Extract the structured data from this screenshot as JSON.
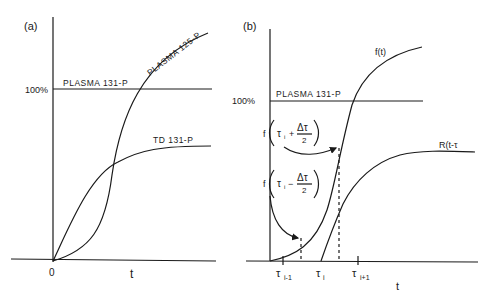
{
  "figure": {
    "panel_a": {
      "label": "(a)",
      "y_axis_marker": "100%",
      "x_origin_label": "0",
      "x_axis_label": "t",
      "curves": [
        {
          "name": "plasma-131-p",
          "label": "PLASMA 131-P",
          "shape": "horizontal line at 100%"
        },
        {
          "name": "plasma-125-p",
          "label": "PLASMA 125-P",
          "shape": "sigmoid rising above 100%"
        },
        {
          "name": "td-131-p",
          "label": "TD 131-P",
          "shape": "concave rising, plateau below 100%"
        }
      ]
    },
    "panel_b": {
      "label": "(b)",
      "y_axis_marker": "100%",
      "x_axis_label": "t",
      "plasma_label": "PLASMA 131-P",
      "curve_f_label": "f(t)",
      "curve_r_label": "R(t-τ",
      "annotation_plus": {
        "prefix": "f",
        "tau": "τ",
        "sub": "i",
        "op": "+",
        "num": "Δτ",
        "den": "2"
      },
      "annotation_minus": {
        "prefix": "f",
        "tau": "τ",
        "sub": "i",
        "op": "−",
        "num": "Δτ",
        "den": "2"
      },
      "ticks": [
        {
          "tau": "τ",
          "sub": "i-1"
        },
        {
          "tau": "τ",
          "sub": "i"
        },
        {
          "tau": "τ",
          "sub": "i+1"
        }
      ]
    }
  }
}
